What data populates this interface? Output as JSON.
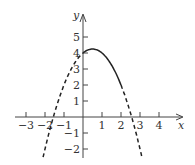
{
  "chart_data": {
    "type": "line",
    "title": "",
    "xlabel": "x",
    "ylabel": "y",
    "xlim": [
      -3.5,
      4.8
    ],
    "ylim": [
      -2.5,
      6
    ],
    "x_ticks": [
      -3,
      -2,
      -1,
      1,
      2,
      3,
      4
    ],
    "y_ticks": [
      -2,
      -1,
      1,
      2,
      3,
      4,
      5
    ],
    "x_tick_labels": [
      "−3",
      "−2",
      "−1",
      "1",
      "2",
      "3",
      "4"
    ],
    "y_tick_labels": [
      "−2",
      "−1",
      "1",
      "2",
      "3",
      "4",
      "5"
    ],
    "grid": false,
    "series": [
      {
        "name": "f(x) = -x^2 + x + 4 on [0,2]",
        "style": "solid",
        "x": [
          0,
          0.5,
          1,
          1.5,
          2
        ],
        "y": [
          4,
          4.25,
          4,
          3.25,
          2
        ]
      },
      {
        "name": "extension left",
        "style": "dashed",
        "x": [
          -2.1,
          -1.5,
          -1,
          -0.5,
          0
        ],
        "y": [
          -2.51,
          0.25,
          2,
          3.25,
          4
        ]
      },
      {
        "name": "extension right",
        "style": "dashed",
        "x": [
          2,
          2.5,
          3,
          3.1
        ],
        "y": [
          2,
          0.25,
          -2,
          -2.51
        ]
      }
    ]
  }
}
